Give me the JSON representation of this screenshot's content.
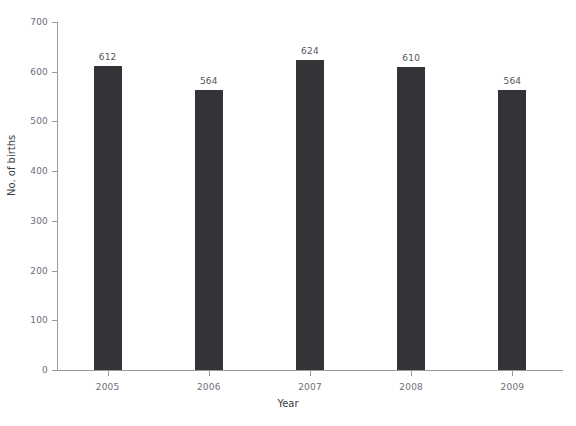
{
  "chart_data": {
    "type": "bar",
    "title": "",
    "xlabel": "Year",
    "ylabel": "No. of births",
    "categories": [
      "2005",
      "2006",
      "2007",
      "2008",
      "2009"
    ],
    "values": [
      612,
      564,
      624,
      610,
      564
    ],
    "data_labels": [
      "612",
      "564",
      "624",
      "610",
      "564"
    ],
    "ylim": [
      0,
      700
    ],
    "yticks": [
      0,
      100,
      200,
      300,
      400,
      500,
      600,
      700
    ],
    "ytick_labels": [
      "0",
      "100",
      "200",
      "300",
      "400",
      "500",
      "600",
      "700"
    ],
    "grid": false,
    "legend": null,
    "bar_color": "#333338",
    "axis_color": "#9a9a9a",
    "tick_label_color": "#6e6e78",
    "axis_title_color": "#3b3b46"
  }
}
